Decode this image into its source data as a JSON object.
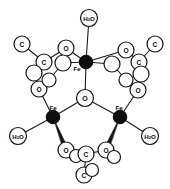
{
  "figure": {
    "background_color": "#ffffff",
    "line_color": "#1a1a1a",
    "metal_fill_color": "#0d0d0d",
    "atom_fill_color": "#ffffff",
    "width": 170,
    "height": 189
  },
  "legend": {
    "metal_symbol": "Fe",
    "oxygen_symbol": "O",
    "carbon_symbol": "C",
    "water_symbol": "H2O",
    "water_symbol_main": "H",
    "water_symbol_sub": "2",
    "water_symbol_tail": "O"
  },
  "atoms": [
    {
      "id": "O-central",
      "label": "O",
      "element": "O",
      "kind": "open",
      "cx": 85,
      "cy": 98,
      "r": 8.5,
      "font": 7.0
    },
    {
      "id": "Fe-top",
      "label": "Fe",
      "element": "Fe",
      "kind": "filled",
      "cx": 86,
      "cy": 62,
      "r": 6.8,
      "font": 6.2,
      "label_dx": -9,
      "label_dy": 6
    },
    {
      "id": "Fe-left",
      "label": "Fe",
      "element": "Fe",
      "kind": "filled",
      "cx": 53,
      "cy": 117,
      "r": 6.8,
      "font": 6.2,
      "label_dx": 0,
      "label_dy": -10
    },
    {
      "id": "Fe-right",
      "label": "Fe",
      "element": "Fe",
      "kind": "filled",
      "cx": 120,
      "cy": 117,
      "r": 6.8,
      "font": 6.2,
      "label_dx": -1,
      "label_dy": -10
    },
    {
      "id": "H2O-top",
      "label": "H2O",
      "element": "OW",
      "kind": "open",
      "cx": 89,
      "cy": 18,
      "r": 8.5,
      "font": 6.2
    },
    {
      "id": "H2O-left",
      "label": "H2O",
      "element": "OW",
      "kind": "open",
      "cx": 18,
      "cy": 136,
      "r": 8.5,
      "font": 6.2
    },
    {
      "id": "H2O-right",
      "label": "H2O",
      "element": "OW",
      "kind": "open",
      "cx": 150,
      "cy": 136,
      "r": 8.5,
      "font": 6.2
    },
    {
      "id": "O-tl-upper",
      "label": "O",
      "element": "O",
      "kind": "open",
      "cx": 66,
      "cy": 48,
      "r": 8.0,
      "font": 6.6
    },
    {
      "id": "O-tl-inner",
      "label": "",
      "element": "O",
      "kind": "open",
      "cx": 63,
      "cy": 63,
      "r": 8.0,
      "font": 6.6
    },
    {
      "id": "C-tl-carboxy",
      "label": "C",
      "element": "C",
      "kind": "open",
      "cx": 44,
      "cy": 62,
      "r": 8.0,
      "font": 6.6
    },
    {
      "id": "C-tl-methyl",
      "label": "C",
      "element": "C",
      "kind": "open",
      "cx": 22,
      "cy": 44,
      "r": 8.0,
      "font": 6.6
    },
    {
      "id": "O-tl-lower",
      "label": "O",
      "element": "O",
      "kind": "open",
      "cx": 39,
      "cy": 89,
      "r": 8.0,
      "font": 6.6
    },
    {
      "id": "O-tl-lower2",
      "label": "",
      "element": "O",
      "kind": "open",
      "cx": 34,
      "cy": 73,
      "r": 8.0,
      "font": 6.6
    },
    {
      "id": "O-tl-extra",
      "label": "",
      "element": "O",
      "kind": "open",
      "cx": 49,
      "cy": 80,
      "r": 7.0,
      "font": 6.6
    },
    {
      "id": "O-tr-upper",
      "label": "O",
      "element": "O",
      "kind": "open",
      "cx": 126,
      "cy": 50,
      "r": 8.0,
      "font": 6.6
    },
    {
      "id": "O-tr-inner",
      "label": "",
      "element": "O",
      "kind": "open",
      "cx": 112,
      "cy": 64,
      "r": 8.0,
      "font": 6.6
    },
    {
      "id": "C-tr-carboxy",
      "label": "C",
      "element": "C",
      "kind": "open",
      "cx": 139,
      "cy": 62,
      "r": 8.0,
      "font": 6.6
    },
    {
      "id": "C-tr-methyl",
      "label": "C",
      "element": "C",
      "kind": "open",
      "cx": 155,
      "cy": 44,
      "r": 8.0,
      "font": 6.6
    },
    {
      "id": "O-tr-lower",
      "label": "O",
      "element": "O",
      "kind": "open",
      "cx": 138,
      "cy": 90,
      "r": 8.0,
      "font": 6.6
    },
    {
      "id": "O-tr-lower2",
      "label": "",
      "element": "O",
      "kind": "open",
      "cx": 141,
      "cy": 74,
      "r": 8.0,
      "font": 6.6
    },
    {
      "id": "O-tr-extra",
      "label": "",
      "element": "O",
      "kind": "open",
      "cx": 126,
      "cy": 80,
      "r": 7.0,
      "font": 6.6
    },
    {
      "id": "O-bl",
      "label": "O",
      "element": "O",
      "kind": "open",
      "cx": 66,
      "cy": 150,
      "r": 8.0,
      "font": 6.6
    },
    {
      "id": "O-bl2",
      "label": "",
      "element": "O",
      "kind": "open",
      "cx": 76,
      "cy": 156,
      "r": 6.5,
      "font": 6.6
    },
    {
      "id": "O-br",
      "label": "O",
      "element": "O",
      "kind": "open",
      "cx": 106,
      "cy": 150,
      "r": 8.0,
      "font": 6.6
    },
    {
      "id": "O-br2",
      "label": "",
      "element": "O",
      "kind": "open",
      "cx": 114,
      "cy": 157,
      "r": 6.5,
      "font": 6.6
    },
    {
      "id": "C-b-carboxy",
      "label": "C",
      "element": "C",
      "kind": "open",
      "cx": 86,
      "cy": 154,
      "r": 8.0,
      "font": 6.6
    },
    {
      "id": "C-b-methyl",
      "label": "C",
      "element": "C",
      "kind": "open",
      "cx": 84,
      "cy": 175,
      "r": 8.0,
      "font": 6.6
    },
    {
      "id": "C-b-methyl2",
      "label": "",
      "element": "C",
      "kind": "open",
      "cx": 92,
      "cy": 170,
      "r": 6.5,
      "font": 6.6
    }
  ],
  "bonds": [
    {
      "from": "Fe-top",
      "to": "H2O-top",
      "style": "thin"
    },
    {
      "from": "Fe-top",
      "to": "O-central",
      "style": "thin"
    },
    {
      "from": "Fe-left",
      "to": "O-central",
      "style": "thin"
    },
    {
      "from": "Fe-right",
      "to": "O-central",
      "style": "thin"
    },
    {
      "from": "Fe-top",
      "to": "O-tl-upper",
      "style": "thin"
    },
    {
      "from": "Fe-top",
      "to": "O-tl-inner",
      "style": "thin"
    },
    {
      "from": "Fe-top",
      "to": "O-tr-upper",
      "style": "thin"
    },
    {
      "from": "Fe-top",
      "to": "O-tr-inner",
      "style": "thin"
    },
    {
      "from": "O-tl-upper",
      "to": "C-tl-carboxy",
      "style": "thin"
    },
    {
      "from": "C-tl-carboxy",
      "to": "C-tl-methyl",
      "style": "thin"
    },
    {
      "from": "C-tl-carboxy",
      "to": "O-tl-lower2",
      "style": "thin"
    },
    {
      "from": "O-tl-lower",
      "to": "Fe-left",
      "style": "thin"
    },
    {
      "from": "O-tl-lower2",
      "to": "O-tl-lower",
      "style": "thin"
    },
    {
      "from": "O-tl-inner",
      "to": "O-tl-extra",
      "style": "thin"
    },
    {
      "from": "O-tr-upper",
      "to": "C-tr-carboxy",
      "style": "thin"
    },
    {
      "from": "C-tr-carboxy",
      "to": "C-tr-methyl",
      "style": "thin"
    },
    {
      "from": "C-tr-carboxy",
      "to": "O-tr-lower2",
      "style": "thin"
    },
    {
      "from": "O-tr-lower",
      "to": "Fe-right",
      "style": "thin"
    },
    {
      "from": "O-tr-lower2",
      "to": "O-tr-lower",
      "style": "thin"
    },
    {
      "from": "O-tr-inner",
      "to": "O-tr-extra",
      "style": "thin"
    },
    {
      "from": "Fe-left",
      "to": "H2O-left",
      "style": "thin"
    },
    {
      "from": "Fe-right",
      "to": "H2O-right",
      "style": "thin"
    },
    {
      "from": "Fe-left",
      "to": "O-bl",
      "style": "wedge"
    },
    {
      "from": "Fe-right",
      "to": "O-br",
      "style": "wedge"
    },
    {
      "from": "O-bl",
      "to": "C-b-carboxy",
      "style": "thin"
    },
    {
      "from": "O-br",
      "to": "C-b-carboxy",
      "style": "thin"
    },
    {
      "from": "C-b-carboxy",
      "to": "C-b-methyl",
      "style": "thin"
    }
  ]
}
